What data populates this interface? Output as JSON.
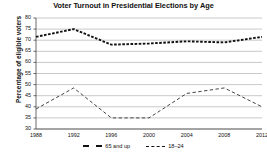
{
  "chart_data": {
    "type": "line",
    "title": "Voter Turnout in Presidential Elections by Age",
    "xlabel": "",
    "ylabel": "Percentage of eligible voters",
    "categories": [
      "1988",
      "1992",
      "1996",
      "2000",
      "2004",
      "2008",
      "2012"
    ],
    "x": [
      1988,
      1992,
      1996,
      2000,
      2004,
      2008,
      2012
    ],
    "ylim": [
      30,
      80
    ],
    "yticks": [
      30,
      35,
      40,
      45,
      50,
      55,
      60,
      65,
      70,
      75,
      80
    ],
    "ytick_labels": [
      "30",
      "35",
      "40",
      "45",
      "50",
      "55",
      "60",
      "65",
      "70",
      "75",
      "80"
    ],
    "grid": true,
    "legend_position": "bottom",
    "series": [
      {
        "name": "65 and up",
        "style": "dotted",
        "color": "#111111",
        "values": [
          71.5,
          75.0,
          68.0,
          68.5,
          69.5,
          69.0,
          71.5
        ]
      },
      {
        "name": "18–24",
        "style": "dashed",
        "color": "#444444",
        "values": [
          39.0,
          48.5,
          35.0,
          35.0,
          46.0,
          48.5,
          40.0
        ]
      }
    ]
  },
  "legend": {
    "items": [
      {
        "label": "65 and up",
        "swatch": "dotted"
      },
      {
        "label": "18–24",
        "swatch": "dashed"
      }
    ]
  }
}
